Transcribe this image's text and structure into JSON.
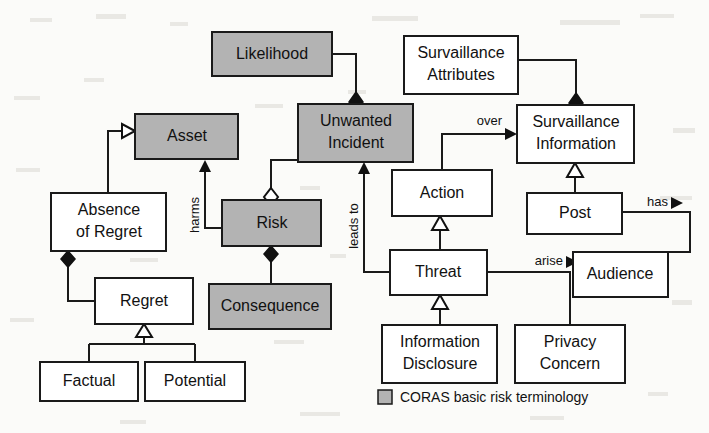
{
  "diagram": {
    "type": "uml-class-diagram",
    "legend": {
      "swatch_color": "#b3b3b3",
      "label": "CORAS basic risk terminology"
    },
    "colors": {
      "coras_fill": "#b3b3b3",
      "plain_fill": "#ffffff",
      "stroke": "#1a1a1a",
      "background": "#fbfbf9"
    },
    "nodes": [
      {
        "id": "likelihood",
        "label": "Likelihood",
        "lines": [
          "Likelihood"
        ],
        "coras": true,
        "x": 212,
        "y": 32,
        "w": 120,
        "h": 44
      },
      {
        "id": "surveillance-attributes",
        "label": "Survaillance Attributes",
        "lines": [
          "Survaillance",
          "Attributes"
        ],
        "coras": false,
        "x": 404,
        "y": 36,
        "w": 114,
        "h": 58
      },
      {
        "id": "asset",
        "label": "Asset",
        "lines": [
          "Asset"
        ],
        "coras": true,
        "x": 135,
        "y": 114,
        "w": 103,
        "h": 45
      },
      {
        "id": "unwanted-incident",
        "label": "Unwanted Incident",
        "lines": [
          "Unwanted",
          "Incident"
        ],
        "coras": true,
        "x": 298,
        "y": 104,
        "w": 115,
        "h": 58
      },
      {
        "id": "surveillance-information",
        "label": "Survaillance Information",
        "lines": [
          "Survaillance",
          "Information"
        ],
        "coras": false,
        "x": 517,
        "y": 105,
        "w": 117,
        "h": 58
      },
      {
        "id": "absence-of-regret",
        "label": "Absence of Regret",
        "lines": [
          "Absence",
          "of Regret"
        ],
        "coras": false,
        "x": 51,
        "y": 193,
        "w": 115,
        "h": 58
      },
      {
        "id": "risk",
        "label": "Risk",
        "lines": [
          "Risk"
        ],
        "coras": true,
        "x": 222,
        "y": 200,
        "w": 99,
        "h": 46
      },
      {
        "id": "action",
        "label": "Action",
        "lines": [
          "Action"
        ],
        "coras": false,
        "x": 392,
        "y": 170,
        "w": 100,
        "h": 46
      },
      {
        "id": "post",
        "label": "Post",
        "lines": [
          "Post"
        ],
        "coras": false,
        "x": 527,
        "y": 193,
        "w": 95,
        "h": 41
      },
      {
        "id": "regret",
        "label": "Regret",
        "lines": [
          "Regret"
        ],
        "coras": false,
        "x": 95,
        "y": 278,
        "w": 98,
        "h": 46
      },
      {
        "id": "consequence",
        "label": "Consequence",
        "lines": [
          "Consequence"
        ],
        "coras": true,
        "x": 209,
        "y": 284,
        "w": 122,
        "h": 45
      },
      {
        "id": "threat",
        "label": "Threat",
        "lines": [
          "Threat"
        ],
        "coras": false,
        "x": 390,
        "y": 250,
        "w": 97,
        "h": 45
      },
      {
        "id": "audience",
        "label": "Audience",
        "lines": [
          "Audience"
        ],
        "coras": false,
        "x": 573,
        "y": 252,
        "w": 95,
        "h": 45
      },
      {
        "id": "factual",
        "label": "Factual",
        "lines": [
          "Factual"
        ],
        "coras": false,
        "x": 40,
        "y": 362,
        "w": 98,
        "h": 39
      },
      {
        "id": "potential",
        "label": "Potential",
        "lines": [
          "Potential"
        ],
        "coras": false,
        "x": 145,
        "y": 362,
        "w": 100,
        "h": 39
      },
      {
        "id": "information-disclosure",
        "label": "Information Disclosure",
        "lines": [
          "Information",
          "Disclosure"
        ],
        "coras": false,
        "x": 382,
        "y": 325,
        "w": 115,
        "h": 58
      },
      {
        "id": "privacy-concern",
        "label": "Privacy Concern",
        "lines": [
          "Privacy",
          "Concern"
        ],
        "coras": false,
        "x": 515,
        "y": 325,
        "w": 110,
        "h": 58
      }
    ],
    "edge_labels": [
      {
        "id": "over",
        "text": "over",
        "x": 505,
        "y": 122,
        "rotated": false,
        "arrow": "right"
      },
      {
        "id": "has",
        "text": "has",
        "x": 656,
        "y": 203,
        "rotated": false,
        "arrow": "right"
      },
      {
        "id": "arise",
        "text": "arise",
        "x": 536,
        "y": 262,
        "rotated": false,
        "arrow": "right"
      },
      {
        "id": "harms",
        "text": "harms",
        "x": 192,
        "y": 215,
        "rotated": true,
        "arrow": "up"
      },
      {
        "id": "leads-to",
        "text": "leads to",
        "x": 351,
        "y": 225,
        "rotated": true,
        "arrow": "up"
      }
    ],
    "relationships": [
      {
        "from": "likelihood",
        "to": "unwanted-incident",
        "type": "composition",
        "end": "filled-diamond"
      },
      {
        "from": "surveillance-attributes",
        "to": "surveillance-information",
        "type": "composition",
        "end": "filled-diamond"
      },
      {
        "from": "absence-of-regret",
        "to": "asset",
        "type": "generalization",
        "end": "hollow-triangle"
      },
      {
        "from": "absence-of-regret",
        "to": "regret",
        "type": "composition",
        "end": "filled-diamond"
      },
      {
        "from": "risk",
        "to": "unwanted-incident",
        "type": "aggregation",
        "end": "hollow-diamond"
      },
      {
        "from": "risk",
        "to": "consequence",
        "type": "composition",
        "end": "filled-diamond"
      },
      {
        "from": "risk",
        "to": "asset",
        "type": "association",
        "end": "arrow",
        "label": "harms"
      },
      {
        "from": "regret",
        "to": "factual",
        "type": "generalization",
        "end": "hollow-triangle"
      },
      {
        "from": "regret",
        "to": "potential",
        "type": "generalization",
        "end": "hollow-triangle"
      },
      {
        "from": "threat",
        "to": "unwanted-incident",
        "type": "association",
        "end": "arrow",
        "label": "leads to"
      },
      {
        "from": "threat",
        "to": "action",
        "type": "generalization",
        "end": "hollow-triangle"
      },
      {
        "from": "threat",
        "to": "surveillance-information",
        "type": "association",
        "end": "arrow",
        "label": "over"
      },
      {
        "from": "threat",
        "to": "privacy-concern",
        "type": "association",
        "end": "arrow",
        "label": "arise"
      },
      {
        "from": "information-disclosure",
        "to": "threat",
        "type": "generalization",
        "end": "hollow-triangle"
      },
      {
        "from": "post",
        "to": "surveillance-information",
        "type": "generalization",
        "end": "hollow-triangle"
      },
      {
        "from": "post",
        "to": "audience",
        "type": "association",
        "end": "arrow",
        "label": "has"
      }
    ]
  }
}
